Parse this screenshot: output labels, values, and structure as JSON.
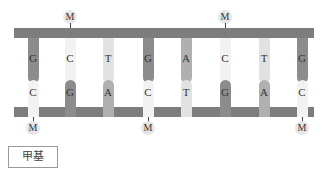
{
  "diagram": {
    "title": "",
    "colors": {
      "strand": "#7d7d7d",
      "G": "#8c8c8c",
      "A": "#b0b0b0",
      "T": "#e2e2e2",
      "C": "#f2f2f2"
    },
    "columns_x": [
      33,
      70,
      108,
      148,
      186,
      225,
      264,
      302
    ],
    "top_strand": [
      "G",
      "C",
      "T",
      "G",
      "A",
      "C",
      "T",
      "G"
    ],
    "bottom_strand": [
      "C",
      "G",
      "A",
      "C",
      "T",
      "G",
      "A",
      "C"
    ],
    "top_methyl_columns": [
      1,
      5
    ],
    "bottom_methyl_columns": [
      0,
      3,
      7
    ],
    "methyl_label": "M",
    "legend": {
      "label": "甲基"
    }
  }
}
